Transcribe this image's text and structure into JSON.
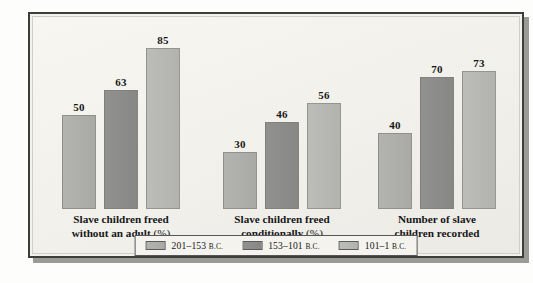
{
  "chart_data": {
    "type": "bar",
    "title": "",
    "xlabel": "",
    "ylabel": "",
    "ylim": [
      0,
      90
    ],
    "grid": false,
    "legend_position": "bottom",
    "categories": [
      "Slave children freed without an adult (%)",
      "Slave children freed conditionally (%)",
      "Number of slave children recorded"
    ],
    "series": [
      {
        "name": "201–153 B.C.",
        "color": "#aeaeab",
        "values": [
          50,
          30,
          40
        ]
      },
      {
        "name": "153–101 B.C.",
        "color": "#8c8c8b",
        "values": [
          63,
          46,
          70
        ]
      },
      {
        "name": "101–1 B.C.",
        "color": "#b7b7b4",
        "values": [
          85,
          56,
          73
        ]
      }
    ]
  },
  "groups": [
    {
      "label_line1": "Slave children freed",
      "label_line2": "without an adult",
      "label_suffix": " (%)",
      "bars": [
        {
          "value": "50",
          "series": 0
        },
        {
          "value": "63",
          "series": 1
        },
        {
          "value": "85",
          "series": 2
        }
      ]
    },
    {
      "label_line1": "Slave children freed",
      "label_line2": "conditionally",
      "label_suffix": " (%)",
      "bars": [
        {
          "value": "30",
          "series": 0
        },
        {
          "value": "46",
          "series": 1
        },
        {
          "value": "56",
          "series": 2
        }
      ]
    },
    {
      "label_line1": "Number of slave",
      "label_line2": "children recorded",
      "label_suffix": "",
      "bars": [
        {
          "value": "40",
          "series": 0
        },
        {
          "value": "70",
          "series": 1
        },
        {
          "value": "73",
          "series": 2
        }
      ]
    }
  ],
  "legend": {
    "items": [
      {
        "range": "201–153",
        "era": "B.C."
      },
      {
        "range": "153–101",
        "era": "B.C."
      },
      {
        "range": "101–1",
        "era": "B.C."
      }
    ]
  },
  "colors": {
    "series_1": "#aeaeab",
    "series_2": "#8c8c8b",
    "series_3": "#b7b7b4",
    "frame_border": "#3d3d3c",
    "background": "#f2f1ec",
    "text": "#17171a"
  }
}
